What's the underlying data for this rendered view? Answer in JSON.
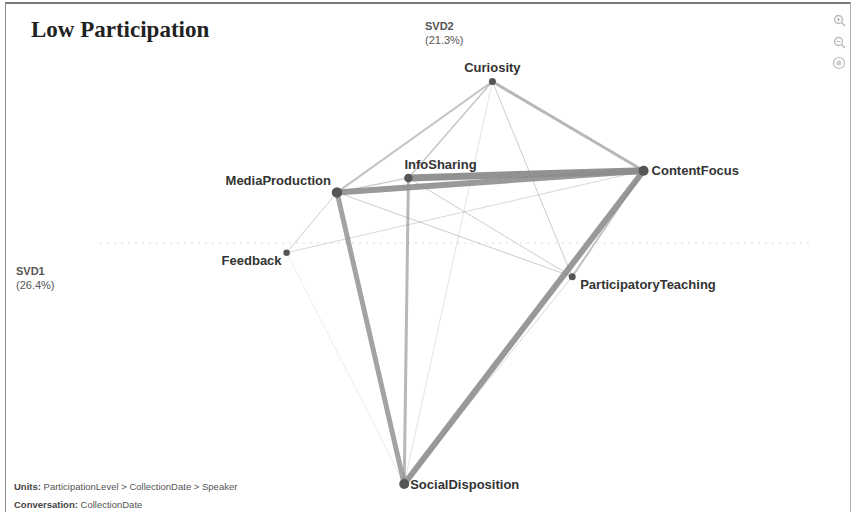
{
  "title": "Low Participation",
  "axes": {
    "x": {
      "name": "SVD1",
      "pct": "(26.4%)"
    },
    "y": {
      "name": "SVD2",
      "pct": "(21.3%)"
    }
  },
  "controls": [
    {
      "name": "zoom-in-icon",
      "glyph": "+"
    },
    {
      "name": "zoom-out-icon",
      "glyph": "−"
    },
    {
      "name": "reset-view-icon",
      "glyph": "◎"
    }
  ],
  "footer": {
    "units_label": "Units:",
    "units_value": "ParticipationLevel > CollectionDate > Speaker",
    "conversation_label": "Conversation:",
    "conversation_value": "CollectionDate"
  },
  "colors": {
    "edge": "#8c8c8c",
    "node": "#555555",
    "label": "#333333"
  },
  "network": {
    "nodes": [
      {
        "id": "Curiosity",
        "label": "Curiosity",
        "x": 0.12,
        "y": 0.67,
        "size": 1.0
      },
      {
        "id": "ContentFocus",
        "label": "ContentFocus",
        "x": 0.48,
        "y": 0.3,
        "size": 1.6
      },
      {
        "id": "InfoSharing",
        "label": "InfoSharing",
        "x": -0.08,
        "y": 0.27,
        "size": 1.3
      },
      {
        "id": "MediaProduction",
        "label": "MediaProduction",
        "x": -0.25,
        "y": 0.21,
        "size": 1.7
      },
      {
        "id": "Feedback",
        "label": "Feedback",
        "x": -0.37,
        "y": -0.04,
        "size": 0.9
      },
      {
        "id": "ParticipatoryTeaching",
        "label": "ParticipatoryTeaching",
        "x": 0.31,
        "y": -0.14,
        "size": 1.0
      },
      {
        "id": "SocialDisposition",
        "label": "SocialDisposition",
        "x": -0.09,
        "y": -1.0,
        "size": 1.6
      }
    ],
    "edges": [
      {
        "s": "MediaProduction",
        "t": "ContentFocus",
        "w": 6
      },
      {
        "s": "InfoSharing",
        "t": "ContentFocus",
        "w": 7
      },
      {
        "s": "ContentFocus",
        "t": "SocialDisposition",
        "w": 6
      },
      {
        "s": "MediaProduction",
        "t": "SocialDisposition",
        "w": 5
      },
      {
        "s": "InfoSharing",
        "t": "SocialDisposition",
        "w": 3
      },
      {
        "s": "Curiosity",
        "t": "ContentFocus",
        "w": 3
      },
      {
        "s": "Curiosity",
        "t": "MediaProduction",
        "w": 2
      },
      {
        "s": "Curiosity",
        "t": "InfoSharing",
        "w": 1.5
      },
      {
        "s": "Curiosity",
        "t": "ParticipatoryTeaching",
        "w": 1
      },
      {
        "s": "Curiosity",
        "t": "SocialDisposition",
        "w": 0.6
      },
      {
        "s": "MediaProduction",
        "t": "InfoSharing",
        "w": 1.2
      },
      {
        "s": "MediaProduction",
        "t": "Feedback",
        "w": 1
      },
      {
        "s": "MediaProduction",
        "t": "ParticipatoryTeaching",
        "w": 1
      },
      {
        "s": "Feedback",
        "t": "ContentFocus",
        "w": 0.8
      },
      {
        "s": "InfoSharing",
        "t": "ParticipatoryTeaching",
        "w": 1
      },
      {
        "s": "ContentFocus",
        "t": "ParticipatoryTeaching",
        "w": 2
      },
      {
        "s": "ParticipatoryTeaching",
        "t": "SocialDisposition",
        "w": 0.8
      },
      {
        "s": "Feedback",
        "t": "SocialDisposition",
        "w": 0.4
      }
    ]
  }
}
